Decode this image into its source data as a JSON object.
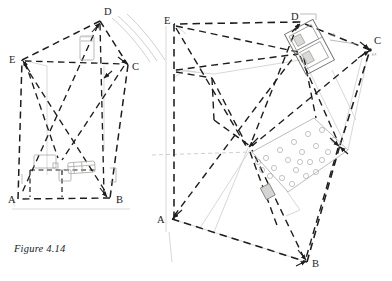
{
  "figure": {
    "caption": "Figure 4.14",
    "plate_count": 2
  },
  "diagrams": [
    {
      "id": "left-plan",
      "name": "left-site-plan",
      "description": "Pentagonal survey plan with dashed triangulation lines",
      "vertices": [
        {
          "label": "A",
          "x": 18,
          "y": 199,
          "label_x": 10,
          "label_y": 202,
          "arrow": false
        },
        {
          "label": "B",
          "x": 110,
          "y": 198,
          "label_x": 116,
          "label_y": 202,
          "arrow": true
        },
        {
          "label": "C",
          "x": 128,
          "y": 65,
          "label_x": 133,
          "label_y": 69,
          "arrow": true
        },
        {
          "label": "D",
          "x": 100,
          "y": 21,
          "label_x": 105,
          "label_y": 15,
          "arrow": true
        },
        {
          "label": "E",
          "x": 22,
          "y": 60,
          "label_x": 11,
          "label_y": 59,
          "arrow": true
        }
      ],
      "outline": "22,60 100,21 128,65 110,198 18,199",
      "interior_lines": [
        "22,60 128,65",
        "100,21 104,198",
        "22,60 110,198",
        "100,21 18,199",
        "104,21 104,198",
        "22,60 60,160",
        "128,65 60,160"
      ],
      "furniture": [
        {
          "x": 34,
          "y": 155,
          "w": 22,
          "h": 13,
          "rot": 0
        },
        {
          "x": 60,
          "y": 170,
          "w": 12,
          "h": 11,
          "rot": 0
        },
        {
          "x": 68,
          "y": 163,
          "w": 26,
          "h": 10,
          "rot": -4
        },
        {
          "x": 80,
          "y": 37,
          "w": 14,
          "h": 23,
          "rot": 0
        }
      ],
      "contours": [
        "M112,18 C126,30 138,44 150,62",
        "M118,16 C132,28 144,43 157,61",
        "M126,14 C140,27 152,42 164,60"
      ],
      "baseline": {
        "x1": 12,
        "y1": 209,
        "x2": 130,
        "y2": 209
      }
    },
    {
      "id": "right-plan",
      "name": "right-site-plan",
      "description": "Rotated pentagonal survey plan with stippled garden area and building block",
      "vertices": [
        {
          "label": "A",
          "x": 172,
          "y": 219,
          "label_x": 159,
          "label_y": 222,
          "arrow": true
        },
        {
          "label": "B",
          "x": 307,
          "y": 262,
          "label_x": 313,
          "label_y": 265,
          "arrow": true
        },
        {
          "label": "C",
          "x": 370,
          "y": 50,
          "label_x": 374,
          "label_y": 43,
          "arrow": true
        },
        {
          "label": "D",
          "x": 300,
          "y": 22,
          "label_x": 293,
          "label_y": 18,
          "arrow": true
        },
        {
          "label": "E",
          "x": 174,
          "y": 24,
          "label_x": 165,
          "label_y": 21,
          "arrow": false
        }
      ],
      "outline": "174,24 300,22 370,50 307,262 172,219",
      "interior_lines": [
        "174,24 300,52",
        "174,70 300,52",
        "300,22 248,148",
        "370,50 248,148",
        "174,24 248,148",
        "172,219 300,52",
        "307,262 248,148",
        "248,148 280,230",
        "340,145 307,262",
        "211,78 248,148",
        "300,52 340,145",
        "340,145 370,50"
      ],
      "stipple_polygon": "252,152 314,118 348,150 288,190",
      "stipple_count": 22,
      "building": {
        "x": 296,
        "y": 28,
        "w": 30,
        "h": 44,
        "rot": -28
      },
      "small_block": {
        "x": 264,
        "y": 186,
        "w": 9,
        "h": 12,
        "rot": -28
      },
      "faint_lines": [
        "174,70 220,74 300,62",
        "166,24 166,230",
        "172,219 307,262",
        "248,148 211,230",
        "340,145 360,60"
      ],
      "datum": {
        "x1": 152,
        "y1": 155,
        "x2": 250,
        "y2": 152
      }
    }
  ],
  "style": {
    "ink": "#1d1d1c",
    "faint": "#b8b8b6",
    "stipple": "#9a9a98",
    "paper": "#ffffff"
  }
}
